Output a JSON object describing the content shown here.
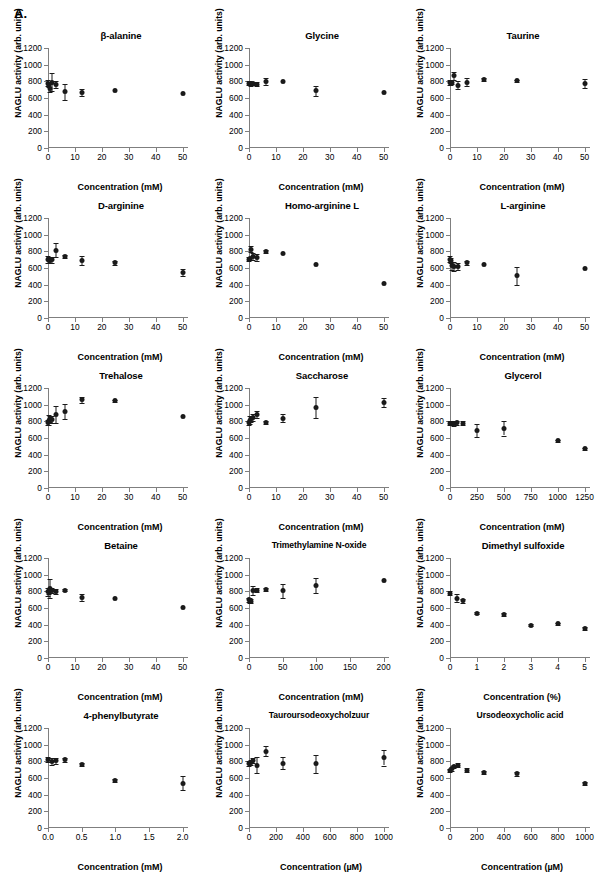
{
  "figure": {
    "panel_label": "A.",
    "y_axis_label": "NAGLU activity (arb. units)",
    "y_ticks": [
      0,
      200,
      400,
      600,
      800,
      1000,
      1200
    ],
    "ylim": [
      0,
      1200
    ]
  },
  "chart_data": [
    {
      "type": "scatter",
      "title": "β-alanine",
      "xlabel": "Concentration (mM)",
      "ylabel": "NAGLU activity (arb. units)",
      "xlim": [
        0,
        52
      ],
      "ylim": [
        0,
        1200
      ],
      "x_ticks": [
        0,
        10,
        20,
        30,
        40,
        50
      ],
      "y_ticks": [
        0,
        200,
        400,
        600,
        800,
        1000,
        1200
      ],
      "grid": false,
      "legend": "none",
      "points": [
        {
          "x": 0.0,
          "y": 780,
          "err": 40
        },
        {
          "x": 0.4,
          "y": 760,
          "err": 30
        },
        {
          "x": 0.8,
          "y": 720,
          "err": 45
        },
        {
          "x": 1.6,
          "y": 790,
          "err": 110
        },
        {
          "x": 3.1,
          "y": 765,
          "err": 40
        },
        {
          "x": 6.2,
          "y": 675,
          "err": 95
        },
        {
          "x": 12.5,
          "y": 665,
          "err": 40
        },
        {
          "x": 25.0,
          "y": 685,
          "err": 10
        },
        {
          "x": 50.0,
          "y": 650,
          "err": 10
        }
      ]
    },
    {
      "type": "scatter",
      "title": "Glycine",
      "xlabel": "Concentration (mM)",
      "ylabel": "NAGLU activity (arb. units)",
      "xlim": [
        0,
        52
      ],
      "ylim": [
        0,
        1200
      ],
      "x_ticks": [
        0,
        10,
        20,
        30,
        40,
        50
      ],
      "y_ticks": [
        0,
        200,
        400,
        600,
        800,
        1000,
        1200
      ],
      "grid": false,
      "legend": "none",
      "points": [
        {
          "x": 0.0,
          "y": 780,
          "err": 25
        },
        {
          "x": 0.4,
          "y": 775,
          "err": 20
        },
        {
          "x": 0.8,
          "y": 770,
          "err": 20
        },
        {
          "x": 1.6,
          "y": 775,
          "err": 20
        },
        {
          "x": 3.1,
          "y": 765,
          "err": 25
        },
        {
          "x": 6.2,
          "y": 800,
          "err": 45
        },
        {
          "x": 12.5,
          "y": 795,
          "err": 10
        },
        {
          "x": 25.0,
          "y": 685,
          "err": 60
        },
        {
          "x": 50.0,
          "y": 670,
          "err": 10
        }
      ]
    },
    {
      "type": "scatter",
      "title": "Taurine",
      "xlabel": "Concentration (mM)",
      "ylabel": "NAGLU activity (arb. units)",
      "xlim": [
        0,
        52
      ],
      "ylim": [
        0,
        1200
      ],
      "x_ticks": [
        0,
        10,
        20,
        30,
        40,
        50
      ],
      "y_ticks": [
        0,
        200,
        400,
        600,
        800,
        1000,
        1200
      ],
      "grid": false,
      "legend": "none",
      "points": [
        {
          "x": 0.0,
          "y": 785,
          "err": 30
        },
        {
          "x": 0.4,
          "y": 780,
          "err": 25
        },
        {
          "x": 0.8,
          "y": 790,
          "err": 25
        },
        {
          "x": 1.6,
          "y": 865,
          "err": 45
        },
        {
          "x": 3.1,
          "y": 755,
          "err": 45
        },
        {
          "x": 6.2,
          "y": 790,
          "err": 50
        },
        {
          "x": 12.5,
          "y": 820,
          "err": 20
        },
        {
          "x": 25.0,
          "y": 805,
          "err": 15
        },
        {
          "x": 50.0,
          "y": 775,
          "err": 55
        }
      ]
    },
    {
      "type": "scatter",
      "title": "D-arginine",
      "xlabel": "Concentration (mM)",
      "ylabel": "NAGLU activity (arb. units)",
      "xlim": [
        0,
        52
      ],
      "ylim": [
        0,
        1200
      ],
      "x_ticks": [
        0,
        10,
        20,
        30,
        40,
        50
      ],
      "y_ticks": [
        0,
        200,
        400,
        600,
        800,
        1000,
        1200
      ],
      "grid": false,
      "legend": "none",
      "points": [
        {
          "x": 0.0,
          "y": 700,
          "err": 40
        },
        {
          "x": 0.4,
          "y": 700,
          "err": 35
        },
        {
          "x": 0.8,
          "y": 695,
          "err": 35
        },
        {
          "x": 1.6,
          "y": 700,
          "err": 35
        },
        {
          "x": 3.1,
          "y": 815,
          "err": 80
        },
        {
          "x": 6.2,
          "y": 735,
          "err": 20
        },
        {
          "x": 12.5,
          "y": 690,
          "err": 50
        },
        {
          "x": 25.0,
          "y": 665,
          "err": 25
        },
        {
          "x": 50.0,
          "y": 545,
          "err": 40
        }
      ]
    },
    {
      "type": "scatter",
      "title": "Homo-arginine L",
      "xlabel": "Concentration (mM)",
      "ylabel": "NAGLU activity (arb. units)",
      "xlim": [
        0,
        52
      ],
      "ylim": [
        0,
        1200
      ],
      "x_ticks": [
        0,
        10,
        20,
        30,
        40,
        50
      ],
      "y_ticks": [
        0,
        200,
        400,
        600,
        800,
        1000,
        1200
      ],
      "grid": false,
      "legend": "none",
      "points": [
        {
          "x": 0.0,
          "y": 705,
          "err": 25
        },
        {
          "x": 0.4,
          "y": 715,
          "err": 20
        },
        {
          "x": 0.8,
          "y": 825,
          "err": 35
        },
        {
          "x": 1.6,
          "y": 740,
          "err": 40
        },
        {
          "x": 3.1,
          "y": 725,
          "err": 45
        },
        {
          "x": 6.2,
          "y": 800,
          "err": 15
        },
        {
          "x": 12.5,
          "y": 775,
          "err": 10
        },
        {
          "x": 25.0,
          "y": 640,
          "err": 10
        },
        {
          "x": 50.0,
          "y": 410,
          "err": 10
        }
      ]
    },
    {
      "type": "scatter",
      "title": "L-arginine",
      "xlabel": "Concentration (mM)",
      "ylabel": "NAGLU activity (arb. units)",
      "xlim": [
        0,
        52
      ],
      "ylim": [
        0,
        1200
      ],
      "x_ticks": [
        0,
        10,
        20,
        30,
        40,
        50
      ],
      "y_ticks": [
        0,
        200,
        400,
        600,
        800,
        1000,
        1200
      ],
      "grid": false,
      "legend": "none",
      "points": [
        {
          "x": 0.0,
          "y": 705,
          "err": 35
        },
        {
          "x": 0.4,
          "y": 690,
          "err": 30
        },
        {
          "x": 0.8,
          "y": 625,
          "err": 50
        },
        {
          "x": 1.6,
          "y": 615,
          "err": 55
        },
        {
          "x": 3.1,
          "y": 620,
          "err": 40
        },
        {
          "x": 6.2,
          "y": 665,
          "err": 25
        },
        {
          "x": 12.5,
          "y": 645,
          "err": 10
        },
        {
          "x": 25.0,
          "y": 505,
          "err": 110
        },
        {
          "x": 50.0,
          "y": 590,
          "err": 10
        }
      ]
    },
    {
      "type": "scatter",
      "title": "Trehalose",
      "xlabel": "Concentration (mM)",
      "ylabel": "NAGLU activity (arb. units)",
      "xlim": [
        0,
        52
      ],
      "ylim": [
        0,
        1200
      ],
      "x_ticks": [
        0,
        10,
        20,
        30,
        40,
        50
      ],
      "y_ticks": [
        0,
        200,
        400,
        600,
        800,
        1000,
        1200
      ],
      "grid": false,
      "legend": "none",
      "points": [
        {
          "x": 0.0,
          "y": 790,
          "err": 30
        },
        {
          "x": 0.4,
          "y": 815,
          "err": 60
        },
        {
          "x": 0.8,
          "y": 830,
          "err": 35
        },
        {
          "x": 1.6,
          "y": 820,
          "err": 40
        },
        {
          "x": 3.1,
          "y": 880,
          "err": 105
        },
        {
          "x": 6.2,
          "y": 915,
          "err": 90
        },
        {
          "x": 12.5,
          "y": 1060,
          "err": 35
        },
        {
          "x": 25.0,
          "y": 1045,
          "err": 15
        },
        {
          "x": 50.0,
          "y": 860,
          "err": 10
        }
      ]
    },
    {
      "type": "scatter",
      "title": "Saccharose",
      "xlabel": "Concentration (mM)",
      "ylabel": "NAGLU activity (arb. units)",
      "xlim": [
        0,
        52
      ],
      "ylim": [
        0,
        1200
      ],
      "x_ticks": [
        0,
        10,
        20,
        30,
        40,
        50
      ],
      "y_ticks": [
        0,
        200,
        400,
        600,
        800,
        1000,
        1200
      ],
      "grid": false,
      "legend": "none",
      "points": [
        {
          "x": 0.0,
          "y": 785,
          "err": 25
        },
        {
          "x": 0.4,
          "y": 815,
          "err": 45
        },
        {
          "x": 0.8,
          "y": 830,
          "err": 40
        },
        {
          "x": 1.6,
          "y": 845,
          "err": 40
        },
        {
          "x": 3.1,
          "y": 885,
          "err": 45
        },
        {
          "x": 6.2,
          "y": 785,
          "err": 20
        },
        {
          "x": 12.5,
          "y": 840,
          "err": 50
        },
        {
          "x": 25.0,
          "y": 970,
          "err": 125
        },
        {
          "x": 50.0,
          "y": 1030,
          "err": 55
        }
      ]
    },
    {
      "type": "scatter",
      "title": "Glycerol",
      "xlabel": "Concentration (mM)",
      "ylabel": "NAGLU activity (arb. units)",
      "xlim": [
        0,
        1300
      ],
      "ylim": [
        0,
        1200
      ],
      "x_ticks": [
        0,
        250,
        500,
        750,
        1000,
        1250
      ],
      "y_ticks": [
        0,
        200,
        400,
        600,
        800,
        1000,
        1200
      ],
      "grid": false,
      "legend": "none",
      "points": [
        {
          "x": 0,
          "y": 780,
          "err": 20
        },
        {
          "x": 10,
          "y": 775,
          "err": 20
        },
        {
          "x": 20,
          "y": 780,
          "err": 20
        },
        {
          "x": 40,
          "y": 775,
          "err": 25
        },
        {
          "x": 65,
          "y": 785,
          "err": 25
        },
        {
          "x": 125,
          "y": 780,
          "err": 25
        },
        {
          "x": 250,
          "y": 690,
          "err": 80
        },
        {
          "x": 500,
          "y": 715,
          "err": 85
        },
        {
          "x": 1000,
          "y": 565,
          "err": 15
        },
        {
          "x": 1250,
          "y": 470,
          "err": 15
        }
      ]
    },
    {
      "type": "scatter",
      "title": "Betaine",
      "xlabel": "Concentration (mM)",
      "ylabel": "NAGLU activity (arb. units)",
      "xlim": [
        0,
        52
      ],
      "ylim": [
        0,
        1200
      ],
      "x_ticks": [
        0,
        10,
        20,
        30,
        40,
        50
      ],
      "y_ticks": [
        0,
        200,
        400,
        600,
        800,
        1000,
        1200
      ],
      "grid": false,
      "legend": "none",
      "points": [
        {
          "x": 0.0,
          "y": 795,
          "err": 45
        },
        {
          "x": 0.4,
          "y": 800,
          "err": 35
        },
        {
          "x": 0.8,
          "y": 835,
          "err": 110
        },
        {
          "x": 1.6,
          "y": 810,
          "err": 35
        },
        {
          "x": 3.1,
          "y": 795,
          "err": 30
        },
        {
          "x": 6.2,
          "y": 815,
          "err": 15
        },
        {
          "x": 12.5,
          "y": 725,
          "err": 45
        },
        {
          "x": 25.0,
          "y": 710,
          "err": 10
        },
        {
          "x": 50.0,
          "y": 605,
          "err": 10
        }
      ]
    },
    {
      "type": "scatter",
      "title": "Trimethylamine N-oxide",
      "xlabel": "Concentration (mM)",
      "ylabel": "NAGLU activity (arb. units)",
      "xlim": [
        0,
        208
      ],
      "ylim": [
        0,
        1200
      ],
      "x_ticks": [
        0,
        50,
        100,
        150,
        200
      ],
      "y_ticks": [
        0,
        200,
        400,
        600,
        800,
        1000,
        1200
      ],
      "grid": false,
      "legend": "none",
      "points": [
        {
          "x": 0,
          "y": 700,
          "err": 25
        },
        {
          "x": 1.5,
          "y": 690,
          "err": 25
        },
        {
          "x": 3,
          "y": 680,
          "err": 25
        },
        {
          "x": 6,
          "y": 810,
          "err": 50
        },
        {
          "x": 12.5,
          "y": 815,
          "err": 25
        },
        {
          "x": 25,
          "y": 820,
          "err": 20
        },
        {
          "x": 50,
          "y": 805,
          "err": 85
        },
        {
          "x": 100,
          "y": 875,
          "err": 90
        },
        {
          "x": 200,
          "y": 930,
          "err": 10
        }
      ]
    },
    {
      "type": "scatter",
      "title": "Dimethyl sulfoxide",
      "xlabel": "Concentration (%)",
      "ylabel": "NAGLU activity (arb. units)",
      "xlim": [
        0,
        5.2
      ],
      "ylim": [
        0,
        1200
      ],
      "x_ticks": [
        0,
        1,
        2,
        3,
        4,
        5
      ],
      "y_ticks": [
        0,
        200,
        400,
        600,
        800,
        1000,
        1200
      ],
      "grid": false,
      "legend": "none",
      "points": [
        {
          "x": 0.0,
          "y": 780,
          "err": 25
        },
        {
          "x": 0.25,
          "y": 720,
          "err": 50
        },
        {
          "x": 0.5,
          "y": 685,
          "err": 20
        },
        {
          "x": 1.0,
          "y": 540,
          "err": 15
        },
        {
          "x": 2.0,
          "y": 520,
          "err": 15
        },
        {
          "x": 3.0,
          "y": 395,
          "err": 15
        },
        {
          "x": 4.0,
          "y": 410,
          "err": 15
        },
        {
          "x": 5.0,
          "y": 355,
          "err": 15
        }
      ]
    },
    {
      "type": "scatter",
      "title": "4-phenylbutyrate",
      "xlabel": "Concentration (mM)",
      "ylabel": "NAGLU activity (arb. units)",
      "xlim": [
        0,
        2.08
      ],
      "ylim": [
        0,
        1200
      ],
      "x_ticks": [
        "0.0",
        "0.5",
        "1.0",
        "1.5",
        "2.0"
      ],
      "x_tick_values": [
        0.0,
        0.5,
        1.0,
        1.5,
        2.0
      ],
      "y_ticks": [
        0,
        200,
        400,
        600,
        800,
        1000,
        1200
      ],
      "grid": false,
      "legend": "none",
      "points": [
        {
          "x": 0.0,
          "y": 825,
          "err": 30
        },
        {
          "x": 0.06,
          "y": 800,
          "err": 40
        },
        {
          "x": 0.12,
          "y": 805,
          "err": 35
        },
        {
          "x": 0.25,
          "y": 820,
          "err": 25
        },
        {
          "x": 0.5,
          "y": 765,
          "err": 20
        },
        {
          "x": 1.0,
          "y": 570,
          "err": 15
        },
        {
          "x": 2.0,
          "y": 540,
          "err": 80
        }
      ]
    },
    {
      "type": "scatter",
      "title": "Tauroursodeoxycholzuur",
      "xlabel": "Concentration (µM)",
      "ylabel": "NAGLU activity (arb. units)",
      "xlim": [
        0,
        1040
      ],
      "ylim": [
        0,
        1200
      ],
      "x_ticks": [
        0,
        200,
        400,
        600,
        800,
        1000
      ],
      "y_ticks": [
        0,
        200,
        400,
        600,
        800,
        1000,
        1200
      ],
      "grid": false,
      "legend": "none",
      "points": [
        {
          "x": 0,
          "y": 775,
          "err": 35
        },
        {
          "x": 15,
          "y": 790,
          "err": 30
        },
        {
          "x": 30,
          "y": 810,
          "err": 35
        },
        {
          "x": 60,
          "y": 755,
          "err": 95
        },
        {
          "x": 125,
          "y": 920,
          "err": 60
        },
        {
          "x": 250,
          "y": 780,
          "err": 70
        },
        {
          "x": 500,
          "y": 770,
          "err": 105
        },
        {
          "x": 1000,
          "y": 845,
          "err": 95
        }
      ]
    },
    {
      "type": "scatter",
      "title": "Ursodeoxycholic acid",
      "xlabel": "Concentration (µM)",
      "ylabel": "NAGLU activity (arb. units)",
      "xlim": [
        0,
        1040
      ],
      "ylim": [
        0,
        1200
      ],
      "x_ticks": [
        0,
        200,
        400,
        600,
        800,
        1000
      ],
      "y_ticks": [
        0,
        200,
        400,
        600,
        800,
        1000,
        1200
      ],
      "grid": false,
      "legend": "none",
      "points": [
        {
          "x": 0,
          "y": 690,
          "err": 20
        },
        {
          "x": 15,
          "y": 710,
          "err": 20
        },
        {
          "x": 30,
          "y": 740,
          "err": 20
        },
        {
          "x": 60,
          "y": 755,
          "err": 20
        },
        {
          "x": 125,
          "y": 695,
          "err": 20
        },
        {
          "x": 250,
          "y": 665,
          "err": 15
        },
        {
          "x": 500,
          "y": 650,
          "err": 20
        },
        {
          "x": 1000,
          "y": 535,
          "err": 15
        }
      ]
    }
  ]
}
